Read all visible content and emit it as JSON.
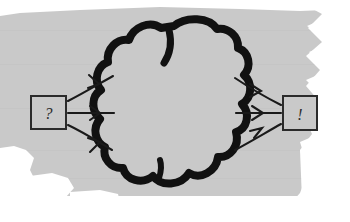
{
  "diagram": {
    "medium": "hand-drawn sketch on torn gray paper",
    "background": {
      "paper_color": "#c9c9c9",
      "outside_color": "#ffffff",
      "edge_style": "torn-ragged"
    },
    "ink_color": "#111111",
    "input_box": {
      "label": "?",
      "name": "input-box",
      "shape": "rectangle",
      "outline_color": "#2b2b2b"
    },
    "output_box": {
      "label": "!",
      "name": "output-box",
      "shape": "rectangle",
      "outline_color": "#2b2b2b"
    },
    "black_box": {
      "label": "",
      "name": "cloud-shape",
      "shape": "cloud",
      "outline_color": "#111111",
      "fill_color": "#c9c9c9",
      "lobes": 8
    },
    "input_arrows": {
      "count": 3,
      "direction": "left-to-right",
      "head_style": "open-v",
      "items": [
        {
          "name": "input-arrow-up",
          "angle": "up"
        },
        {
          "name": "input-arrow-straight",
          "angle": "straight"
        },
        {
          "name": "input-arrow-down",
          "angle": "down"
        }
      ]
    },
    "output_arrows": {
      "count": 3,
      "direction": "left-to-right",
      "head_style": "open-v",
      "items": [
        {
          "name": "output-arrow-up",
          "angle": "up"
        },
        {
          "name": "output-arrow-straight",
          "angle": "straight"
        },
        {
          "name": "output-arrow-down",
          "angle": "down"
        }
      ]
    }
  }
}
